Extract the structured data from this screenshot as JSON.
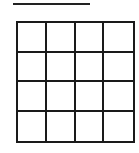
{
  "diagram": {
    "title_line": {
      "visible": true,
      "color": "#222222"
    },
    "grid": {
      "rows": 4,
      "cols": 4,
      "line_color": "#1a1a1a",
      "cells_filled": false
    }
  }
}
